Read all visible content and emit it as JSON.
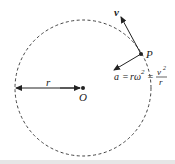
{
  "diagram": {
    "type": "uniform-circular-motion",
    "circle": {
      "center": [
        83,
        88
      ],
      "radius": 68,
      "style": "dashed"
    },
    "center_label": "O",
    "point_label": "P",
    "radius_label": "r",
    "velocity_label": "v",
    "acceleration": {
      "a": "a",
      "eq1": "=",
      "r_omega": "rω",
      "exp": "2",
      "eq2": "=",
      "num": "v",
      "num_exp": "2",
      "den": "r"
    },
    "colors": {
      "stroke": "#222222",
      "circle": "#444444"
    }
  }
}
